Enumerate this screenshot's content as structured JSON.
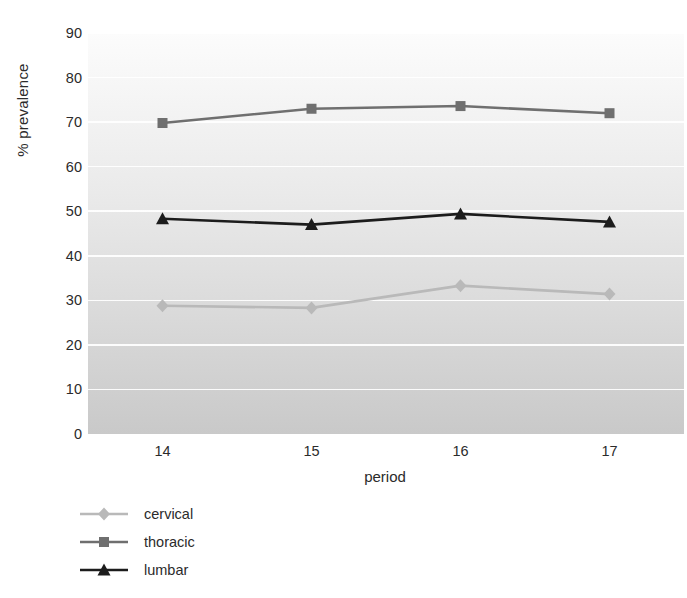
{
  "chart_data": {
    "type": "line",
    "title": "",
    "xlabel": "period",
    "ylabel": "% prevalence",
    "categories": [
      "14",
      "15",
      "16",
      "17"
    ],
    "x": [
      14,
      15,
      16,
      17
    ],
    "xlim": [
      13.5,
      17.5
    ],
    "ylim": [
      0,
      90
    ],
    "ytick_labels": [
      "0",
      "10",
      "20",
      "30",
      "40",
      "50",
      "60",
      "70",
      "80",
      "90"
    ],
    "yticks": [
      0,
      10,
      20,
      30,
      40,
      50,
      60,
      70,
      80,
      90
    ],
    "grid": true,
    "legend_position": "below-left",
    "series": [
      {
        "name": "cervical",
        "values": [
          28.8,
          28.3,
          33.3,
          31.4
        ],
        "color": "#b9b9b9",
        "marker": "diamond"
      },
      {
        "name": "thoracic",
        "values": [
          69.8,
          73.0,
          73.6,
          72.0
        ],
        "color": "#6f6f6f",
        "marker": "square"
      },
      {
        "name": "lumbar",
        "values": [
          48.3,
          47.0,
          49.4,
          47.6
        ],
        "color": "#1c1c1c",
        "marker": "triangle"
      }
    ]
  },
  "axes": {
    "y_title": "% prevalence",
    "x_title": "period"
  },
  "legend": {
    "items": [
      {
        "label": "cervical"
      },
      {
        "label": "thoracic"
      },
      {
        "label": "lumbar"
      }
    ]
  },
  "colors": {
    "cervical": "#b9b9b9",
    "thoracic": "#6f6f6f",
    "lumbar": "#1c1c1c",
    "gridline": "#ffffff",
    "plot_background_top": "#fcfcfc",
    "plot_background_bottom": "#c9c9c9",
    "text": "#2b2b2b"
  }
}
